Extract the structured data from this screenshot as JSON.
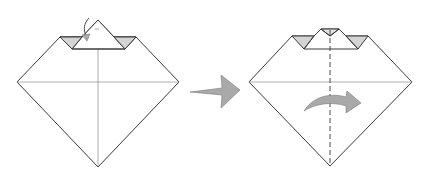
{
  "diagram": {
    "type": "origami-instruction",
    "steps": [
      {
        "id": "step-a",
        "description": "Diamond with top point and two side flaps folded down; curved arrow indicating fold of top point behind/down",
        "shape": "diamond-with-folded-top",
        "creases": [
          "horizontal-center",
          "vertical-center"
        ],
        "arrow": "curved-fold-arrow"
      },
      {
        "id": "step-b",
        "description": "Top point folded down; dashed valley fold line on vertical center; curved arrow indicating fold in half left to right",
        "shape": "diamond-with-folded-top",
        "creases": [
          "horizontal-center"
        ],
        "fold_lines": [
          "vertical-valley-dashed"
        ],
        "arrow": "curved-arrow-right"
      }
    ],
    "transition_arrow": "big-right-arrow",
    "colors": {
      "line": "#3a3a3a",
      "crease": "#8a8a8a",
      "shading": "#d4d4d4",
      "arrow": "#a9a9a9"
    }
  }
}
